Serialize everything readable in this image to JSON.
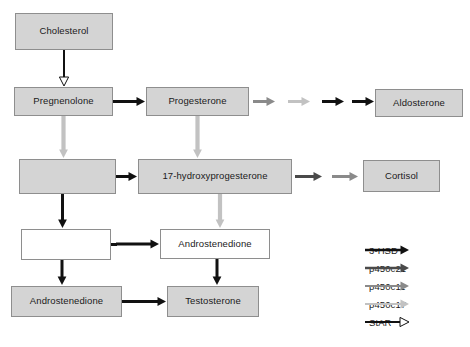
{
  "figure": {
    "type": "flowchart",
    "colors": {
      "box_fill_gray": "#d4d4d4",
      "box_fill_white": "#ffffff",
      "box_border": "#8e8e8e",
      "arrow_black": "#111111",
      "arrow_dark_gray": "#4a4a4a",
      "arrow_medium_gray": "#8a8a8a",
      "arrow_light_gray": "#c2c2c2",
      "text": "#1a1a1a"
    }
  },
  "nodes": [
    {
      "id": "cholesterol",
      "label": "Cholesterol",
      "fill": "gray",
      "x": 15,
      "y": 13,
      "w": 98,
      "h": 37
    },
    {
      "id": "pregnenolone",
      "label": "Pregnenolone",
      "fill": "gray",
      "x": 14,
      "y": 87,
      "w": 99,
      "h": 29
    },
    {
      "id": "progesterone",
      "label": "Progesterone",
      "fill": "gray",
      "x": 146,
      "y": 87,
      "w": 103,
      "h": 29
    },
    {
      "id": "aldosterone",
      "label": "Aldosterone",
      "fill": "gray",
      "x": 375,
      "y": 89,
      "w": 88,
      "h": 28
    },
    {
      "id": "blank-gray",
      "label": "",
      "fill": "gray",
      "x": 19,
      "y": 159,
      "w": 97,
      "h": 35
    },
    {
      "id": "17-ohp",
      "label": "17-hydroxyprogesterone",
      "fill": "gray",
      "x": 138,
      "y": 159,
      "w": 154,
      "h": 35
    },
    {
      "id": "cortisol",
      "label": "Cortisol",
      "fill": "gray",
      "x": 363,
      "y": 160,
      "w": 77,
      "h": 32
    },
    {
      "id": "blank-white",
      "label": "",
      "fill": "white",
      "x": 21,
      "y": 229,
      "w": 90,
      "h": 31
    },
    {
      "id": "androstenedione-white",
      "label": "Androstenedione",
      "fill": "white",
      "x": 160,
      "y": 229,
      "w": 110,
      "h": 30
    },
    {
      "id": "androstenedione-gray",
      "label": "Androstenedione",
      "fill": "gray",
      "x": 11,
      "y": 286,
      "w": 111,
      "h": 31
    },
    {
      "id": "testosterone",
      "label": "Testosterone",
      "fill": "gray",
      "x": 167,
      "y": 286,
      "w": 92,
      "h": 31
    }
  ],
  "legend": {
    "x": 363,
    "y": 243,
    "items": [
      {
        "label": "3-HSD",
        "color": "#111111",
        "head": "solid",
        "width": 2.6
      },
      {
        "label": "p450c21",
        "color": "#4a4a4a",
        "head": "solid",
        "width": 2.4
      },
      {
        "label": "p450c11",
        "color": "#8a8a8a",
        "head": "solid",
        "width": 2.2
      },
      {
        "label": "p450c17",
        "color": "#c2c2c2",
        "head": "solid",
        "width": 2.2
      },
      {
        "label": "StAR",
        "color": "#111111",
        "head": "hollow",
        "width": 2.0
      }
    ]
  },
  "edges": [
    {
      "from": "cholesterol",
      "to": "pregnenolone",
      "enzyme": "StAR",
      "color": "#111111",
      "head": "hollow",
      "orientation": "vertical"
    },
    {
      "from": "pregnenolone",
      "to": "progesterone",
      "enzyme": "3-HSD",
      "color": "#111111",
      "head": "solid",
      "orientation": "horizontal"
    },
    {
      "from": "pregnenolone",
      "to": "blank-gray",
      "enzyme": "p450c17",
      "color": "#c2c2c2",
      "head": "solid",
      "orientation": "vertical"
    },
    {
      "from": "progesterone",
      "to": "17-ohp",
      "enzyme": "p450c17",
      "color": "#c2c2c2",
      "head": "solid",
      "orientation": "vertical"
    },
    {
      "from": "blank-gray",
      "to": "17-ohp",
      "enzyme": "3-HSD",
      "color": "#111111",
      "head": "solid",
      "orientation": "horizontal"
    },
    {
      "from": "blank-gray",
      "to": "blank-white",
      "enzyme": "3-HSD",
      "color": "#111111",
      "head": "solid",
      "orientation": "vertical"
    },
    {
      "from": "17-ohp",
      "to": "androstenedione-white",
      "enzyme": "p450c17",
      "color": "#c2c2c2",
      "head": "solid",
      "orientation": "vertical"
    },
    {
      "from": "blank-white",
      "to": "androstenedione-white",
      "enzyme": "3-HSD",
      "color": "#111111",
      "head": "solid",
      "orientation": "horizontal"
    },
    {
      "from": "blank-white",
      "to": "androstenedione-gray",
      "enzyme": "3-HSD",
      "color": "#111111",
      "head": "solid",
      "orientation": "vertical"
    },
    {
      "from": "androstenedione-white",
      "to": "testosterone",
      "enzyme": "3-HSD",
      "color": "#111111",
      "head": "solid",
      "orientation": "vertical"
    },
    {
      "from": "androstenedione-gray",
      "to": "testosterone",
      "enzyme": "3-HSD",
      "color": "#111111",
      "head": "solid",
      "orientation": "horizontal"
    },
    {
      "from": "progesterone",
      "to": "aldosterone",
      "enzyme": "p450c21, p450c11, 3-HSD, 3-HSD",
      "color": "#8a8a8a",
      "head": "solid",
      "orientation": "horizontal-chain"
    },
    {
      "from": "17-ohp",
      "to": "cortisol",
      "enzyme": "p450c21, p450c11",
      "color": "#4a4a4a",
      "head": "solid",
      "orientation": "horizontal-chain"
    }
  ],
  "caption": {
    "text": ""
  }
}
